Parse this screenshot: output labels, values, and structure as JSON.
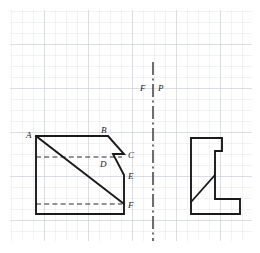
{
  "figure": {
    "background_color": "#ffffff",
    "width": 260,
    "height": 253
  },
  "grid": {
    "name": "graph-paper-grid",
    "cell_size": 11,
    "minor_color": "#d8dde4",
    "major_color": "#b9c2cc",
    "major_every": 4,
    "origin_x": 10,
    "origin_y": 10,
    "cols": 22,
    "rows": 21
  },
  "projection_axis": {
    "name": "fold-line",
    "style": "dash-dot",
    "color": "#4a4a4a",
    "x": 153,
    "y_top": 62,
    "y_bottom": 241,
    "label_left": "F",
    "label_right": "P"
  },
  "front_view": {
    "name": "front-view-outline",
    "stroke_color": "#1a1a1a",
    "hidden_line_color": "#2b2b2b",
    "outline_points": "36,136 108,136 124,154 113,154 124,175 124,204 124,214 36,214",
    "diagonal": {
      "x1": 36,
      "y1": 136,
      "x2": 124,
      "y2": 204
    },
    "hidden_lines": [
      {
        "x1": 36,
        "y1": 157,
        "x2": 122,
        "y2": 157
      },
      {
        "x1": 36,
        "y1": 204,
        "x2": 122,
        "y2": 204
      }
    ],
    "vertices": [
      {
        "id": "A",
        "label": "A",
        "x": 36,
        "y": 136,
        "lx": 26,
        "ly": 135
      },
      {
        "id": "B",
        "label": "B",
        "x": 108,
        "y": 136,
        "lx": 103,
        "ly": 132
      },
      {
        "id": "C",
        "label": "C",
        "x": 124,
        "y": 154,
        "lx": 129,
        "ly": 156
      },
      {
        "id": "D",
        "label": "D",
        "x": 113,
        "y": 154,
        "lx": 103,
        "ly": 165
      },
      {
        "id": "E",
        "label": "E",
        "x": 124,
        "y": 175,
        "lx": 129,
        "ly": 178
      },
      {
        "id": "F",
        "label": "F",
        "x": 124,
        "y": 204,
        "lx": 129,
        "ly": 207
      }
    ]
  },
  "side_view": {
    "name": "side-view-outline",
    "stroke_color": "#1a1a1a",
    "outline_points": "191,138 222,138 222,151 215,151 215,199 240,199 240,214 191,214",
    "diagonal": {
      "x1": 191,
      "y1": 202,
      "x2": 215,
      "y2": 175
    }
  }
}
